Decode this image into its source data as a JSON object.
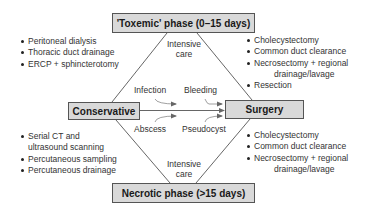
{
  "diagram": {
    "phases": {
      "toxemic": "'Toxemic' phase (0–15 days)",
      "necrotic": "Necrotic phase (>15 days)"
    },
    "nodes": {
      "conservative": "Conservative",
      "surgery": "Surgery"
    },
    "edge_labels": {
      "top_intensive_care_line1": "Intensive",
      "top_intensive_care_line2": "care",
      "bottom_intensive_care_line1": "Intensive",
      "bottom_intensive_care_line2": "care",
      "infection": "Infection",
      "bleeding": "Bleeding",
      "abscess": "Abscess",
      "pseudocyst": "Pseudocyst"
    },
    "lists": {
      "toxemic_conservative": [
        "Peritoneal dialysis",
        "Thoracic duct drainage",
        "ERCP + sphincterotomy"
      ],
      "toxemic_surgery": [
        "Cholecystectomy",
        "Common duct clearance",
        "Necrosectomy + regional",
        "drainage/lavage",
        "Resection"
      ],
      "necrotic_conservative": [
        "Serial CT and",
        "ultrasound scanning",
        "Percutaneous sampling",
        "Percutaneous drainage"
      ],
      "necrotic_surgery": [
        "Cholecystectomy",
        "Common duct clearance",
        "Necrosectomy + regional",
        "drainage/lavage"
      ]
    },
    "colors": {
      "box_fill": "#d9d9d9",
      "box_border": "#555555",
      "line": "#555555",
      "text": "#333333"
    }
  }
}
